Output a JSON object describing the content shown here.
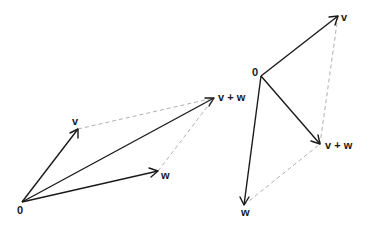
{
  "diagrams": [
    {
      "name": "left-parallelogram",
      "points": {
        "origin": [
          22,
          202
        ],
        "v": [
          78,
          129
        ],
        "w": [
          158,
          171
        ],
        "vw": [
          214,
          98
        ]
      },
      "labels": {
        "origin": "0",
        "v": "v",
        "w": "w",
        "vw": "v + w"
      }
    },
    {
      "name": "right-parallelogram",
      "points": {
        "origin": [
          261,
          76
        ],
        "v": [
          338,
          16
        ],
        "w": [
          244,
          205
        ],
        "vw": [
          320,
          144
        ]
      },
      "labels": {
        "origin": "0",
        "v": "v",
        "w": "w",
        "vw": "v + w"
      }
    }
  ],
  "colors": {
    "vector": "#1a1a1a",
    "dashed": "#b0b0b0",
    "background": "#ffffff"
  }
}
